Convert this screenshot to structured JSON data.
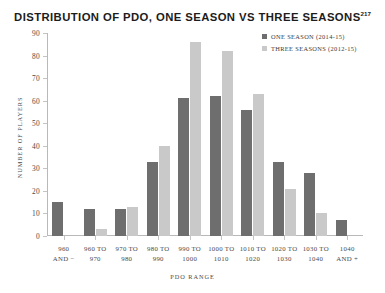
{
  "chart_data": {
    "type": "bar",
    "title": "DISTRIBUTION OF PDO, ONE SEASON VS THREE SEASONS",
    "title_superscript": "217",
    "xlabel": "PDO RANGE",
    "ylabel": "NUMBER OF PLAYERS",
    "ylim": [
      0,
      90
    ],
    "yticks": [
      0,
      10,
      20,
      30,
      40,
      50,
      60,
      70,
      80,
      90
    ],
    "grid": false,
    "legend_position": "top-right",
    "categories": [
      "960\nAND −",
      "960 TO\n970",
      "970 TO\n980",
      "980 TO\n990",
      "990 TO\n1000",
      "1000 TO\n1010",
      "1010 TO\n1020",
      "1020 TO\n1030",
      "1030 TO\n1040",
      "1040\nAND +"
    ],
    "series": [
      {
        "name": "ONE SEASON (2014-15)",
        "color": "#6e6e6e",
        "values": [
          15,
          12,
          12,
          33,
          61,
          62,
          56,
          33,
          28,
          7
        ]
      },
      {
        "name": "THREE SEASONS (2012-15)",
        "color": "#c9c9c9",
        "values": [
          0,
          3,
          13,
          40,
          86,
          82,
          63,
          21,
          10,
          0
        ]
      }
    ]
  }
}
